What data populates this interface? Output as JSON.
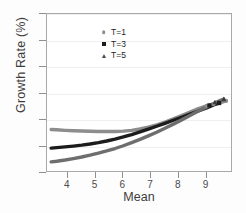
{
  "chart_data": {
    "type": "line",
    "title": "",
    "xlabel": "Mean",
    "ylabel": "Growth Rate (%)",
    "xlim": [
      3.25,
      9.95
    ],
    "ylim": [
      0,
      30
    ],
    "xticks": [
      4,
      5,
      6,
      7,
      8,
      9
    ],
    "yticks": [
      0,
      5,
      10,
      15,
      20,
      25,
      30
    ],
    "grid": true,
    "legend_position": "top-left",
    "series": [
      {
        "name": "T=1",
        "marker": "circle",
        "color": "#8d8d8d",
        "x": [
          3.4,
          3.6,
          3.9,
          4.2,
          4.5,
          4.8,
          5.1,
          5.4,
          5.7,
          6.0,
          6.3,
          6.6,
          6.9,
          7.2,
          7.5,
          7.8,
          8.1,
          8.4,
          8.7,
          9.0,
          9.25,
          9.45,
          9.7
        ],
        "y": [
          8.2,
          8.15,
          8.05,
          7.98,
          7.92,
          7.87,
          7.84,
          7.82,
          7.83,
          7.9,
          8.05,
          8.3,
          8.65,
          9.1,
          9.62,
          10.2,
          10.85,
          11.5,
          12.15,
          12.65,
          13.0,
          13.2,
          13.6
        ]
      },
      {
        "name": "T=3",
        "marker": "square",
        "color": "#1c1c1c",
        "x": [
          3.4,
          3.6,
          3.9,
          4.2,
          4.5,
          4.8,
          5.1,
          5.4,
          5.7,
          6.0,
          6.3,
          6.6,
          6.9,
          7.2,
          7.5,
          7.8,
          8.1,
          8.4,
          8.7,
          9.0,
          9.25,
          9.45
        ],
        "y": [
          4.7,
          4.78,
          4.92,
          5.08,
          5.26,
          5.48,
          5.74,
          6.04,
          6.4,
          6.8,
          7.25,
          7.75,
          8.28,
          8.82,
          9.38,
          9.95,
          10.52,
          11.1,
          11.7,
          12.3,
          12.85,
          13.2
        ]
      },
      {
        "name": "T=5",
        "marker": "triangle",
        "color": "#6e6e6e",
        "x": [
          3.4,
          3.6,
          3.9,
          4.2,
          4.5,
          4.8,
          5.1,
          5.4,
          5.7,
          6.0,
          6.3,
          6.6,
          6.9,
          7.2,
          7.5,
          7.8,
          8.1,
          8.4,
          8.7,
          9.0,
          9.25,
          9.5,
          9.62
        ],
        "y": [
          2.1,
          2.22,
          2.45,
          2.72,
          3.02,
          3.36,
          3.74,
          4.16,
          4.62,
          5.14,
          5.72,
          6.34,
          7.0,
          7.7,
          8.45,
          9.22,
          10.02,
          10.85,
          11.68,
          12.48,
          13.1,
          13.7,
          13.95
        ]
      }
    ],
    "endpoint_markers": [
      {
        "series": "T=1",
        "x": 9.0,
        "y": 12.65,
        "marker": "circle",
        "color": "#8d8d8d"
      },
      {
        "series": "T=1",
        "x": 9.25,
        "y": 13.0,
        "marker": "circle",
        "color": "#8d8d8d"
      },
      {
        "series": "T=1",
        "x": 9.7,
        "y": 13.6,
        "marker": "circle",
        "color": "#8d8d8d"
      },
      {
        "series": "T=3",
        "x": 9.1,
        "y": 12.75,
        "marker": "square",
        "color": "#1c1c1c"
      },
      {
        "series": "T=3",
        "x": 9.45,
        "y": 13.2,
        "marker": "square",
        "color": "#1c1c1c"
      },
      {
        "series": "T=5",
        "x": 9.3,
        "y": 13.35,
        "marker": "triangle",
        "color": "#3a3a3a"
      },
      {
        "series": "T=5",
        "x": 9.62,
        "y": 13.95,
        "marker": "triangle",
        "color": "#3a3a3a"
      }
    ]
  },
  "axis": {
    "ylabels": [
      "0",
      "5",
      "10",
      "15",
      "20",
      "25",
      "30"
    ],
    "xlabels": [
      "4",
      "5",
      "6",
      "7",
      "8",
      "9"
    ],
    "ytitle": "Growth Rate (%)",
    "xtitle": "Mean"
  },
  "legend": {
    "items": [
      {
        "label": "T=1",
        "marker": "circle-marker-icon",
        "color": "#8d8d8d"
      },
      {
        "label": "T=3",
        "marker": "square-marker-icon",
        "color": "#1c1c1c"
      },
      {
        "label": "T=5",
        "marker": "triangle-marker-icon",
        "color": "#4a4a4a"
      }
    ]
  }
}
